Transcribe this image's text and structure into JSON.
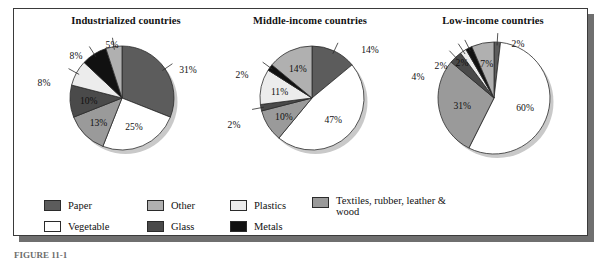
{
  "figure": {
    "caption": "FIGURE 11-1"
  },
  "legend": {
    "columns": [
      {
        "items": [
          {
            "label": "Paper",
            "color": "#5c5c5c"
          },
          {
            "label": "Vegetable",
            "color": "#ffffff"
          }
        ]
      },
      {
        "items": [
          {
            "label": "Other",
            "color": "#b0b0b0"
          },
          {
            "label": "Glass",
            "color": "#4a4a4a"
          }
        ]
      },
      {
        "items": [
          {
            "label": "Plastics",
            "color": "#ececec"
          },
          {
            "label": "Metals",
            "color": "#111111"
          }
        ]
      },
      {
        "items": [
          {
            "label": "Textiles, rubber, leather & wood",
            "color": "#9a9a9a"
          }
        ]
      }
    ]
  },
  "chart_data": [
    {
      "type": "pie",
      "title": "Industrialized countries",
      "categories": [
        "Paper",
        "Vegetable",
        "Textiles, rubber, leather & wood",
        "Glass",
        "Plastics",
        "Metals",
        "Other"
      ],
      "values": [
        31,
        25,
        13,
        10,
        8,
        8,
        5
      ],
      "colors": [
        "#5c5c5c",
        "#ffffff",
        "#9a9a9a",
        "#4a4a4a",
        "#ececec",
        "#111111",
        "#b0b0b0"
      ],
      "labels": [
        "31%",
        "25%",
        "13%",
        "10%",
        "8%",
        "8%",
        "5%"
      ],
      "label_placement": [
        "outside",
        "inside",
        "inside",
        "inside",
        "outside",
        "outside",
        "outside"
      ],
      "start_angle": 0,
      "direction": "clockwise",
      "xlabel": "",
      "ylabel": "",
      "legend_position": "bottom"
    },
    {
      "type": "pie",
      "title": "Middle-income countries",
      "categories": [
        "Paper",
        "Vegetable",
        "Textiles, rubber, leather & wood",
        "Glass",
        "Plastics",
        "Metals",
        "Other"
      ],
      "values": [
        14,
        47,
        10,
        2,
        11,
        2,
        14
      ],
      "colors": [
        "#5c5c5c",
        "#ffffff",
        "#9a9a9a",
        "#4a4a4a",
        "#ececec",
        "#111111",
        "#b0b0b0"
      ],
      "labels": [
        "14%",
        "47%",
        "10%",
        "2%",
        "11%",
        "2%",
        "14%"
      ],
      "label_placement": [
        "outside",
        "inside",
        "inside",
        "outside",
        "inside",
        "outside",
        "inside"
      ],
      "start_angle": 0,
      "direction": "clockwise",
      "xlabel": "",
      "ylabel": "",
      "legend_position": "bottom"
    },
    {
      "type": "pie",
      "title": "Low-income countries",
      "categories": [
        "Paper",
        "Vegetable",
        "Textiles, rubber, leather & wood",
        "Glass",
        "Plastics",
        "Metals",
        "Other"
      ],
      "values": [
        2,
        60,
        31,
        4,
        2,
        2,
        7
      ],
      "colors": [
        "#5c5c5c",
        "#ffffff",
        "#9a9a9a",
        "#4a4a4a",
        "#ececec",
        "#111111",
        "#b0b0b0"
      ],
      "labels": [
        "2%",
        "60%",
        "31%",
        "4%",
        "2%",
        "2%",
        "7%"
      ],
      "label_placement": [
        "outside",
        "inside",
        "inside",
        "outside",
        "outside",
        "outside",
        "inside"
      ],
      "start_angle": 0,
      "direction": "clockwise",
      "xlabel": "",
      "ylabel": "",
      "legend_position": "bottom"
    }
  ]
}
